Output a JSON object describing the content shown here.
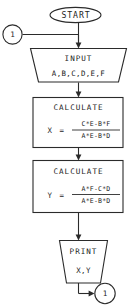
{
  "diagram": {
    "type": "flowchart",
    "colors": {
      "stroke": "#2b2b2b",
      "fill": "#ffffff",
      "text": "#1c1c1c",
      "background": "#ffffff"
    }
  },
  "nodes": {
    "connector_in": {
      "shape": "circle",
      "label": "1",
      "role": "off-page-connector-entry"
    },
    "start": {
      "shape": "oval",
      "label": "START",
      "role": "terminator"
    },
    "input": {
      "shape": "trapezoid-input",
      "header": "INPUT",
      "variables": "A,B,C,D,E,F",
      "role": "input-output"
    },
    "calculate_x": {
      "shape": "rectangle",
      "header": "CALCULATE",
      "assign_var": "X",
      "equals": "=",
      "numerator": "C*E-B*F",
      "denominator": "A*E-B*D",
      "role": "process"
    },
    "calculate_y": {
      "shape": "rectangle",
      "header": "CALCULATE",
      "assign_var": "Y",
      "equals": "=",
      "numerator": "A*F-C*D",
      "denominator": "A*E-B*D",
      "role": "process"
    },
    "print": {
      "shape": "trapezoid-output",
      "header": "PRINT",
      "variables": "X,Y",
      "role": "input-output"
    },
    "connector_out": {
      "shape": "circle",
      "label": "1",
      "role": "off-page-connector-exit"
    }
  },
  "edges": [
    {
      "from": "connector_in",
      "to": "input",
      "style": "elbow-right-then-down-arrow"
    },
    {
      "from": "start",
      "to": "input",
      "style": "straight-down-arrow"
    },
    {
      "from": "input",
      "to": "calculate_x",
      "style": "straight-down-arrow"
    },
    {
      "from": "calculate_x",
      "to": "calculate_y",
      "style": "straight-down-arrow"
    },
    {
      "from": "calculate_y",
      "to": "print",
      "style": "straight-down-arrow"
    },
    {
      "from": "print",
      "to": "connector_out",
      "style": "elbow-down-then-right-arrow"
    }
  ]
}
